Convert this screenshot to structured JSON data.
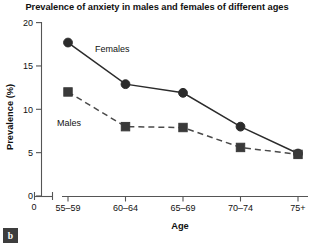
{
  "figure": {
    "panel_label": "b"
  },
  "chart_data": {
    "type": "line",
    "title": "Prevalence of anxiety in males and females of different ages",
    "xlabel": "Age",
    "ylabel": "Prevalence (%)",
    "categories": [
      "55–59",
      "60–64",
      "65–69",
      "70–74",
      "75+"
    ],
    "ylim": [
      0,
      20
    ],
    "yticks": [
      0,
      5,
      10,
      15,
      20
    ],
    "ytick_labels": [
      "0",
      "5",
      "10",
      "15",
      "20"
    ],
    "axis_origin_label": "0",
    "grid": false,
    "legend_position": "inline-annotation",
    "series": [
      {
        "name": "Females",
        "values": [
          17.7,
          12.9,
          11.9,
          8.0,
          4.9
        ],
        "marker": "circle",
        "linestyle": "solid",
        "color": "#2b2b2b",
        "label_x": 95,
        "label_y": 52
      },
      {
        "name": "Males",
        "values": [
          12.0,
          8.0,
          7.9,
          5.6,
          4.8
        ],
        "marker": "square",
        "linestyle": "dashed",
        "color": "#4a4a4a",
        "label_x": 57,
        "label_y": 126
      }
    ]
  }
}
